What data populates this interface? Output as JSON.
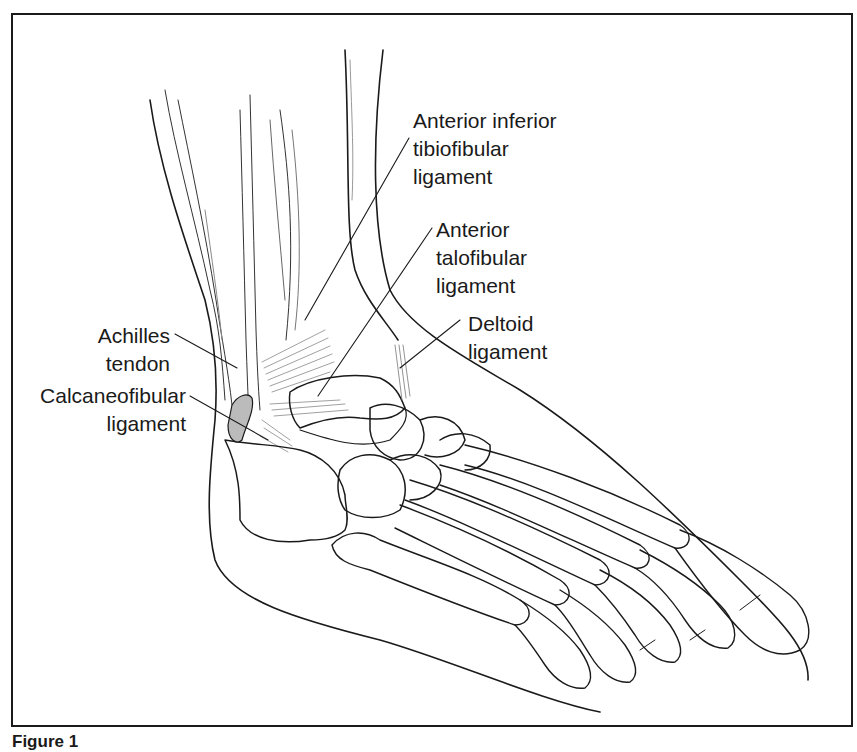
{
  "figure": {
    "caption": "Figure 1",
    "frame_color": "#1a1a1a"
  },
  "labels": {
    "anterior_inferior_tibiofibular": {
      "lines": [
        "Anterior inferior",
        "tibiofibular",
        "ligament"
      ]
    },
    "anterior_talofibular": {
      "lines": [
        "Anterior",
        "talofibular",
        "ligament"
      ]
    },
    "deltoid": {
      "lines": [
        "Deltoid",
        "ligament"
      ]
    },
    "achilles": {
      "lines": [
        "Achilles",
        "tendon"
      ]
    },
    "calcaneofibular": {
      "lines": [
        "Calcaneofibular",
        "ligament"
      ]
    }
  }
}
